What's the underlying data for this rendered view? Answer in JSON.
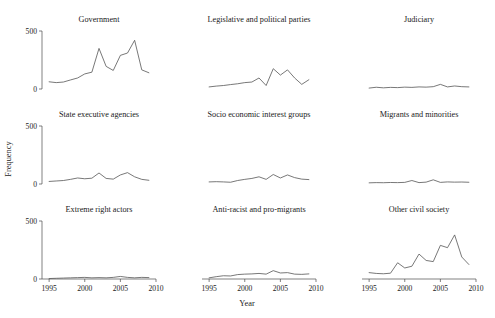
{
  "figure": {
    "xlabel": "Year",
    "ylabel": "Frequency",
    "ytick_labels": [
      "500",
      "0"
    ],
    "xtick_labels": [
      "1995",
      "2000",
      "2005",
      "2010"
    ]
  },
  "chart_data": {
    "type": "line",
    "title": "",
    "xlabel": "Year",
    "ylabel": "Frequency",
    "xlim": [
      1994,
      2010
    ],
    "ylim": [
      0,
      500
    ],
    "yticks": [
      0,
      500
    ],
    "xticks": [
      1995,
      2000,
      2005,
      2010
    ],
    "grid": false,
    "legend": "none",
    "layout": {
      "rows": 3,
      "cols": 3,
      "shared_x": true,
      "shared_y": true
    },
    "x": [
      1995,
      1996,
      1997,
      1998,
      1999,
      2000,
      2001,
      2002,
      2003,
      2004,
      2005,
      2006,
      2007,
      2008,
      2009
    ],
    "panels": [
      {
        "row": 0,
        "col": 0,
        "title": "Government",
        "values": [
          62,
          55,
          60,
          78,
          95,
          130,
          145,
          350,
          195,
          160,
          290,
          310,
          420,
          165,
          140
        ]
      },
      {
        "row": 0,
        "col": 1,
        "title": "Legislative and political parties",
        "values": [
          18,
          25,
          30,
          38,
          45,
          55,
          60,
          95,
          30,
          175,
          120,
          165,
          95,
          40,
          80
        ]
      },
      {
        "row": 0,
        "col": 2,
        "title": "Judiciary",
        "values": [
          8,
          15,
          10,
          14,
          12,
          16,
          14,
          18,
          16,
          20,
          40,
          18,
          26,
          20,
          18
        ]
      },
      {
        "row": 1,
        "col": 0,
        "title": "State executive agencies",
        "values": [
          22,
          26,
          30,
          40,
          52,
          45,
          50,
          95,
          48,
          42,
          78,
          98,
          62,
          40,
          32
        ]
      },
      {
        "row": 1,
        "col": 1,
        "title": "Socio economic interest groups",
        "values": [
          18,
          20,
          18,
          15,
          30,
          40,
          48,
          62,
          40,
          82,
          52,
          78,
          55,
          42,
          38
        ]
      },
      {
        "row": 1,
        "col": 2,
        "title": "Migrants and minorities",
        "values": [
          10,
          12,
          11,
          13,
          12,
          14,
          30,
          12,
          16,
          36,
          14,
          18,
          16,
          17,
          15
        ]
      },
      {
        "row": 2,
        "col": 0,
        "title": "Extreme right actors",
        "values": [
          4,
          6,
          8,
          10,
          12,
          14,
          10,
          12,
          10,
          14,
          22,
          14,
          10,
          14,
          12
        ]
      },
      {
        "row": 2,
        "col": 1,
        "title": "Anti-racist and pro-migrants",
        "values": [
          10,
          20,
          28,
          26,
          38,
          42,
          44,
          48,
          42,
          72,
          52,
          55,
          42,
          40,
          44
        ]
      },
      {
        "row": 2,
        "col": 2,
        "title": "Other civil society",
        "values": [
          55,
          48,
          45,
          50,
          140,
          95,
          110,
          215,
          160,
          150,
          290,
          270,
          380,
          190,
          125
        ]
      }
    ]
  }
}
